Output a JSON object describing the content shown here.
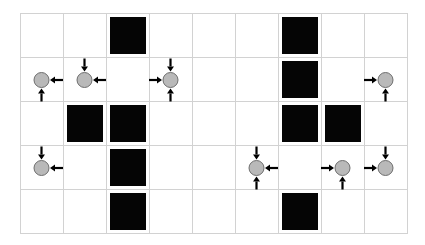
{
  "diagram": {
    "type": "grid-diagram",
    "grid": {
      "columns": 9,
      "rows": 5,
      "origin_x": 20,
      "origin_y": 13,
      "cell_width": 43,
      "cell_height": 44,
      "line_color": "#d2d2d2"
    },
    "blocks": [
      {
        "row": 0,
        "col": 2
      },
      {
        "row": 0,
        "col": 6
      },
      {
        "row": 1,
        "col": 6
      },
      {
        "row": 2,
        "col": 1
      },
      {
        "row": 2,
        "col": 2
      },
      {
        "row": 2,
        "col": 6
      },
      {
        "row": 2,
        "col": 7
      },
      {
        "row": 3,
        "col": 2
      },
      {
        "row": 4,
        "col": 2
      },
      {
        "row": 4,
        "col": 6
      }
    ],
    "block_color": "#050505",
    "nodes": [
      {
        "row": 1,
        "col": 0,
        "incoming": [
          "right",
          "bottom"
        ]
      },
      {
        "row": 1,
        "col": 1,
        "incoming": [
          "top",
          "right"
        ]
      },
      {
        "row": 1,
        "col": 3,
        "incoming": [
          "top",
          "left",
          "bottom"
        ]
      },
      {
        "row": 1,
        "col": 8,
        "incoming": [
          "left",
          "bottom"
        ]
      },
      {
        "row": 3,
        "col": 0,
        "incoming": [
          "top",
          "right"
        ]
      },
      {
        "row": 3,
        "col": 5,
        "incoming": [
          "top",
          "right",
          "bottom"
        ]
      },
      {
        "row": 3,
        "col": 7,
        "incoming": [
          "left",
          "bottom"
        ]
      },
      {
        "row": 3,
        "col": 8,
        "incoming": [
          "top",
          "left"
        ]
      }
    ],
    "node_fill": "#b9b9b9",
    "node_stroke": "#6e6e6e",
    "arrow_color": "#000000"
  }
}
